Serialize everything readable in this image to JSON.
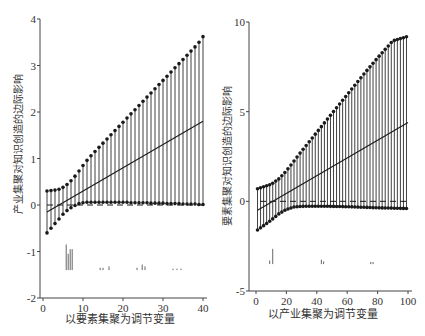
{
  "chart_data": [
    {
      "type": "line",
      "title": "",
      "xlabel": "以要素集聚为调节变量",
      "ylabel": "产业集聚对知识创造的边际影响",
      "xlim": [
        0,
        40
      ],
      "ylim": [
        -2,
        4
      ],
      "xticks": [
        0,
        10,
        20,
        30,
        40
      ],
      "yticks": [
        -2,
        -1,
        0,
        1,
        2,
        3,
        4
      ],
      "grid": false,
      "legend": null,
      "x_range": [
        1,
        40
      ],
      "series": [
        {
          "name": "upper confidence bound",
          "style": "dots",
          "x_start": 1,
          "x_end": 40,
          "values": [
            0.3,
            0.31,
            0.32,
            0.34,
            0.38,
            0.44,
            0.52,
            0.62,
            0.73,
            0.85,
            0.96,
            1.06,
            1.15,
            1.24,
            1.33,
            1.42,
            1.51,
            1.6,
            1.69,
            1.78,
            1.87,
            1.96,
            2.05,
            2.14,
            2.23,
            2.32,
            2.41,
            2.5,
            2.59,
            2.68,
            2.77,
            2.86,
            2.95,
            3.04,
            3.13,
            3.22,
            3.31,
            3.4,
            3.5,
            3.62
          ]
        },
        {
          "name": "marginal effect",
          "style": "line",
          "x_start": 1,
          "x_end": 40,
          "values_endpoints": [
            -0.15,
            1.8
          ]
        },
        {
          "name": "lower confidence bound",
          "style": "dots",
          "x_start": 1,
          "x_end": 40,
          "values": [
            -0.6,
            -0.5,
            -0.4,
            -0.3,
            -0.2,
            -0.12,
            -0.06,
            -0.01,
            0.03,
            0.05,
            0.06,
            0.06,
            0.06,
            0.06,
            0.06,
            0.06,
            0.06,
            0.06,
            0.06,
            0.06,
            0.06,
            0.05,
            0.05,
            0.05,
            0.05,
            0.05,
            0.04,
            0.04,
            0.04,
            0.04,
            0.03,
            0.03,
            0.03,
            0.03,
            0.02,
            0.02,
            0.02,
            0.02,
            0.01,
            0.01
          ]
        },
        {
          "name": "zero reference",
          "style": "dashed",
          "value": 0
        }
      ],
      "rug_histogram": {
        "baseline": -1.4,
        "bars": [
          {
            "x": 5.8,
            "height": 0.55
          },
          {
            "x": 6.3,
            "height": 0.35
          },
          {
            "x": 6.8,
            "height": 0.45
          },
          {
            "x": 7.3,
            "height": 0.45
          },
          {
            "x": 14.3,
            "height": 0.05
          },
          {
            "x": 15.0,
            "height": 0.05
          },
          {
            "x": 16.5,
            "height": 0.08
          },
          {
            "x": 23.5,
            "height": 0.05
          },
          {
            "x": 24.8,
            "height": 0.12
          },
          {
            "x": 25.5,
            "height": 0.08
          },
          {
            "x": 32.5,
            "height": 0.03
          },
          {
            "x": 33.5,
            "height": 0.03
          },
          {
            "x": 34.5,
            "height": 0.03
          }
        ]
      }
    },
    {
      "type": "line",
      "title": "",
      "xlabel": "以产业集聚为调节变量",
      "ylabel": "要素集聚对知识创造的边际影响",
      "xlim": [
        0,
        100
      ],
      "ylim": [
        -5,
        10
      ],
      "xticks": [
        0,
        20,
        40,
        60,
        80,
        100
      ],
      "yticks": [
        -5,
        0,
        5,
        10
      ],
      "grid": false,
      "legend": null,
      "x_range": [
        1,
        100
      ],
      "series": [
        {
          "name": "upper confidence bound",
          "style": "dots",
          "x_start": 1,
          "x_end": 100,
          "control_points": [
            [
              1,
              0.7
            ],
            [
              10,
              0.95
            ],
            [
              15,
              1.25
            ],
            [
              20,
              1.7
            ],
            [
              25,
              2.25
            ],
            [
              30,
              2.8
            ],
            [
              40,
              3.85
            ],
            [
              50,
              4.9
            ],
            [
              60,
              5.95
            ],
            [
              70,
              7.0
            ],
            [
              80,
              8.0
            ],
            [
              90,
              8.95
            ],
            [
              100,
              9.2
            ]
          ]
        },
        {
          "name": "marginal effect",
          "style": "line",
          "x_start": 1,
          "x_end": 100,
          "values_endpoints": [
            -0.5,
            4.4
          ]
        },
        {
          "name": "lower confidence bound",
          "style": "dots",
          "x_start": 1,
          "x_end": 100,
          "control_points": [
            [
              1,
              -1.6
            ],
            [
              10,
              -1.05
            ],
            [
              15,
              -0.7
            ],
            [
              20,
              -0.45
            ],
            [
              25,
              -0.32
            ],
            [
              30,
              -0.28
            ],
            [
              40,
              -0.27
            ],
            [
              50,
              -0.28
            ],
            [
              60,
              -0.3
            ],
            [
              70,
              -0.33
            ],
            [
              80,
              -0.36
            ],
            [
              90,
              -0.38
            ],
            [
              100,
              -0.4
            ]
          ]
        },
        {
          "name": "zero reference",
          "style": "dashed",
          "value": 0
        }
      ],
      "rug_histogram": {
        "baseline": -3.5,
        "bars": [
          {
            "x": 9.0,
            "height": 0.2
          },
          {
            "x": 11.0,
            "height": 0.85
          },
          {
            "x": 43.0,
            "height": 0.25
          },
          {
            "x": 44.5,
            "height": 0.15
          },
          {
            "x": 75.5,
            "height": 0.12
          },
          {
            "x": 77.0,
            "height": 0.12
          }
        ]
      }
    }
  ],
  "left_panel": {
    "ylabel": "产业集聚对知识创造的边际影响",
    "xlabel": "以要素集聚为调节变量",
    "yticks": [
      "4",
      "3",
      "2",
      "1",
      "0",
      "-1",
      "-2"
    ],
    "xticks": [
      "0",
      "10",
      "20",
      "30",
      "40"
    ]
  },
  "right_panel": {
    "ylabel": "要素集聚对知识创造的边际影响",
    "xlabel": "以产业集聚为调节变量",
    "yticks": [
      "10",
      "5",
      "0",
      "-5"
    ],
    "xticks": [
      "0",
      "20",
      "40",
      "60",
      "80",
      "100"
    ]
  },
  "colors": {
    "ink": "#1a1a1a",
    "axis": "#444444",
    "stem": "#2a2a2a",
    "background": "#ffffff"
  }
}
